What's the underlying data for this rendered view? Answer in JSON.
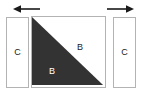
{
  "diagram": {
    "background_color": "#ffffff",
    "width": 147,
    "height": 97,
    "arrows": [
      {
        "name": "left-arrow",
        "direction": "left",
        "glyph": "←",
        "color": "#1a1a1a",
        "x": 14,
        "y": 9,
        "length": 26
      },
      {
        "name": "right-arrow",
        "direction": "right",
        "glyph": "→",
        "color": "#1a1a1a",
        "x": 107,
        "y": 9,
        "length": 26
      }
    ],
    "panels": [
      {
        "name": "left-panel",
        "label": "C",
        "fill": "#ffffff",
        "stroke": "#b3b3b3",
        "label_color": "#1a1a1a"
      },
      {
        "name": "right-panel",
        "label": "C",
        "fill": "#ffffff",
        "stroke": "#b3b3b3",
        "label_color": "#1a1a1a"
      }
    ],
    "square": {
      "name": "center-square",
      "fill": "#ffffff",
      "stroke": "#b3b3b3",
      "triangle": {
        "name": "shaded-triangle",
        "fill": "#333333",
        "position": "lower-left",
        "hypotenuse": "top-left to bottom-right",
        "label": "B",
        "label_color": "#ffffff"
      },
      "upper_region": {
        "name": "light-triangle",
        "fill": "#ffffff",
        "position": "upper-right",
        "label": "B",
        "label_color": "#1a1a1a"
      }
    }
  }
}
